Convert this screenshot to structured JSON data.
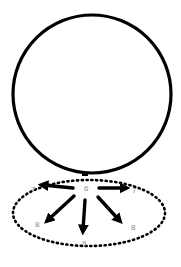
{
  "diagram": {
    "type": "sketch",
    "colors": {
      "stroke": "#000000",
      "label": "#8a8a8a",
      "background": "#ffffff"
    },
    "circle": {
      "cx": 92,
      "cy": 94,
      "r": 79
    },
    "base_ellipse": {
      "cx": 89,
      "cy": 213,
      "rx": 76,
      "ry": 33,
      "style": "dotted"
    },
    "center_label": "6",
    "arrows": [
      {
        "direction": "left",
        "label": "7"
      },
      {
        "direction": "right",
        "label": "7"
      },
      {
        "direction": "down-left",
        "label": "8"
      },
      {
        "direction": "down",
        "label": "9"
      },
      {
        "direction": "down-right",
        "label": "8"
      }
    ]
  }
}
